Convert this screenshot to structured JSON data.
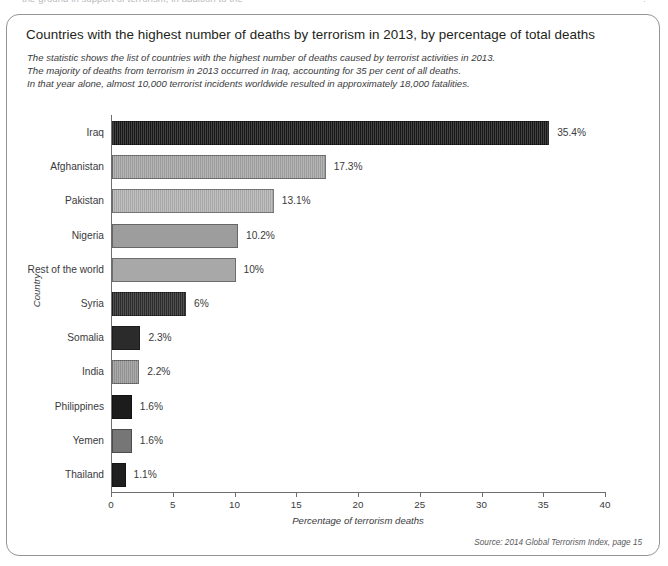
{
  "page": {
    "top_cut_text_left": "the ground in support of terrorism, in addition to the",
    "top_cut_text_right": "."
  },
  "figure": {
    "title": "Countries with the highest number of deaths by terrorism in 2013, by percentage of total deaths",
    "subtitle_lines": [
      "The statistic shows the list of countries with the highest number of deaths caused by terrorist activities in 2013.",
      "The majority of deaths from terrorism in 2013 occurred in Iraq, accounting for 35 per cent of all deaths.",
      "In that year alone, almost 10,000 terrorist incidents worldwide resulted in approximately 18,000 fatalities."
    ],
    "source": "Source: 2014 Global Terrorism Index, page 15"
  },
  "chart_data": {
    "type": "bar",
    "orientation": "horizontal",
    "title": "Countries with the highest number of deaths by terrorism in 2013, by percentage of total deaths",
    "xlabel": "Percentage of terrorism deaths",
    "ylabel": "Country",
    "xlim": [
      0,
      40
    ],
    "xticks": [
      0,
      5,
      10,
      15,
      20,
      25,
      30,
      35,
      40
    ],
    "grid": false,
    "legend": "none",
    "categories": [
      "Iraq",
      "Afghanistan",
      "Pakistan",
      "Nigeria",
      "Rest of the world",
      "Syria",
      "Somalia",
      "India",
      "Philippines",
      "Yemen",
      "Thailand"
    ],
    "values": [
      35.4,
      17.3,
      13.1,
      10.2,
      10,
      6,
      2.3,
      2.2,
      1.6,
      1.6,
      1.1
    ],
    "data_labels": [
      "35.4%",
      "17.3%",
      "13.1%",
      "10.2%",
      "10%",
      "6%",
      "2.3%",
      "2.2%",
      "1.6%",
      "1.6%",
      "1.1%"
    ],
    "bar_colors": [
      "#1a1a1a",
      "#a6a6a6",
      "#b2b2b2",
      "#9d9d9d",
      "#a8a8a8",
      "#2e2e2e",
      "#2b2b2b",
      "#9a9a9a",
      "#1c1c1c",
      "#767676",
      "#1f1f1f"
    ],
    "bar_textures": [
      "stripe",
      "stripe",
      "stripe",
      "flat",
      "flat",
      "stripe",
      "flat",
      "stripe",
      "flat",
      "flat",
      "flat"
    ]
  },
  "colors": {
    "frame": "#939598",
    "axis": "#6d6e71",
    "text": "#231f20",
    "muted_text": "#3a3a3c"
  }
}
